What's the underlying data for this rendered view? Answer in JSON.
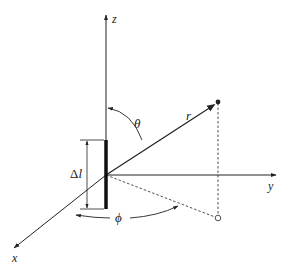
{
  "diagram": {
    "axes": {
      "x_label": "x",
      "y_label": "y",
      "z_label": "z"
    },
    "labels": {
      "r": "r",
      "theta": "θ",
      "phi": "ϕ",
      "dipole_length_delta": "Δ",
      "dipole_length_l": "l"
    },
    "colors": {
      "line": "#222222",
      "background": "#ffffff"
    }
  }
}
